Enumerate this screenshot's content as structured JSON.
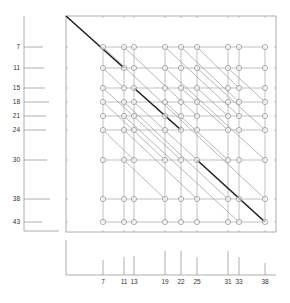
{
  "diagram": {
    "type": "dotplot-alignment",
    "row_values": [
      7,
      11,
      15,
      18,
      21,
      24,
      30,
      38,
      43
    ],
    "col_values": [
      7,
      11,
      13,
      19,
      22,
      25,
      31,
      33,
      38
    ],
    "row_y": [
      47,
      68,
      88,
      102,
      116,
      130,
      160,
      199,
      222
    ],
    "col_x": [
      103,
      124,
      134,
      165,
      181,
      197,
      228,
      239,
      265
    ],
    "row_bar_end_x": [
      43,
      44,
      45,
      49,
      46,
      46,
      47,
      50,
      42
    ],
    "col_bar_top_y": [
      260,
      257,
      256,
      251,
      251,
      257,
      251,
      257,
      263
    ],
    "highlight_segments": [
      {
        "from": [
          0,
          0
        ],
        "to": [
          38,
          43
        ],
        "note": "main-origin",
        "start_px": [
          66,
          16
        ],
        "end_col": 11,
        "end_row": 11
      },
      {
        "from_col": 13,
        "from_row": 15,
        "to_col": 22,
        "to_row": 24
      },
      {
        "from_col": 25,
        "from_row": 30,
        "to_col": 38,
        "to_row": 43
      }
    ],
    "box": {
      "left": 66,
      "top": 16,
      "right": 276,
      "bottom": 232
    },
    "colors": {
      "grid": "#a8a8a8",
      "diag": "#9a9a9a",
      "highlight": "#222222",
      "circle": "#8c8c8c",
      "axis": "#9a9a9a",
      "label": "#333333"
    }
  }
}
